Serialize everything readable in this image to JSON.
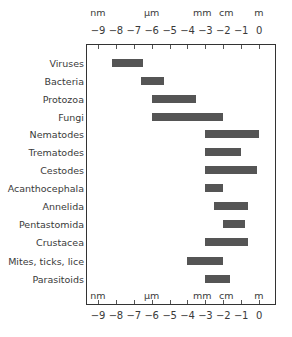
{
  "chart_data": {
    "type": "bar",
    "orientation": "horizontal-range",
    "title": "",
    "xlabel": "log10 size (m)",
    "ylabel": "",
    "xlim": [
      -9.7,
      0.9
    ],
    "x_ticks": [
      -9,
      -8,
      -7,
      -6,
      -5,
      -4,
      -3,
      -2,
      -1,
      0
    ],
    "x_tick_labels": [
      "−9",
      "−8",
      "−7",
      "−6",
      "−5",
      "−4",
      "−3",
      "−2",
      "−1",
      "0"
    ],
    "unit_labels": [
      {
        "label": "nm",
        "at": -9
      },
      {
        "label": "µm",
        "at": -6
      },
      {
        "label": "mm",
        "at": -3
      },
      {
        "label": "cm",
        "at": -2
      },
      {
        "label": "m",
        "at": 0
      }
    ],
    "grid": false,
    "legend": null,
    "categories": [
      "Viruses",
      "Bacteria",
      "Protozoa",
      "Fungi",
      "Nematodes",
      "Trematodes",
      "Cestodes",
      "Acanthocephala",
      "Annelida",
      "Pentastomida",
      "Crustacea",
      "Mites, ticks, lice",
      "Parasitoids"
    ],
    "series": [
      {
        "name": "size range (log10 m)",
        "ranges": [
          [
            -8.2,
            -6.5
          ],
          [
            -6.6,
            -5.3
          ],
          [
            -6.0,
            -3.5
          ],
          [
            -6.0,
            -2.0
          ],
          [
            -3.0,
            0.0
          ],
          [
            -3.0,
            -1.0
          ],
          [
            -3.0,
            -0.1
          ],
          [
            -3.0,
            -2.0
          ],
          [
            -2.5,
            -0.6
          ],
          [
            -2.0,
            -0.8
          ],
          [
            -3.0,
            -0.6
          ],
          [
            -4.0,
            -2.0
          ],
          [
            -3.0,
            -1.6
          ]
        ]
      }
    ],
    "bar_color": "#555555"
  }
}
